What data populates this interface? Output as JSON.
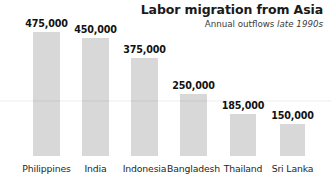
{
  "chart_data": {
    "type": "bar",
    "title": "Labor migration from Asia",
    "subtitle_prefix": "Annual outflows ",
    "subtitle_period": "late 1990s",
    "xlabel": "",
    "ylabel": "",
    "ylim": [
      0,
      500000
    ],
    "grid": false,
    "legend": "none",
    "categories": [
      "Philippines",
      "India",
      "Indonesia",
      "Bangladesh",
      "Thailand",
      "Sri Lanka"
    ],
    "values": [
      475000,
      450000,
      375000,
      250000,
      185000,
      150000
    ],
    "value_labels": [
      "475,000",
      "450,000",
      "375,000",
      "250,000",
      "185,000",
      "150,000"
    ],
    "bar_color": "#d8d8d8",
    "text_color": "#111111",
    "background_color": "#ffffff"
  },
  "bars": [
    {
      "category": "Philippines",
      "value": 475000,
      "label": "475,000",
      "left": 33,
      "width": 27,
      "height": 124
    },
    {
      "category": "India",
      "value": 450000,
      "label": "450,000",
      "left": 82,
      "width": 27,
      "height": 118
    },
    {
      "category": "Indonesia",
      "value": 375000,
      "label": "375,000",
      "left": 131,
      "width": 27,
      "height": 98
    },
    {
      "category": "Bangladesh",
      "value": 250000,
      "label": "250,000",
      "left": 180,
      "width": 27,
      "height": 62
    },
    {
      "category": "Thailand",
      "value": 185000,
      "label": "185,000",
      "left": 230,
      "width": 26,
      "height": 42
    },
    {
      "category": "Sri Lanka",
      "value": 150000,
      "label": "150,000",
      "left": 280,
      "width": 25,
      "height": 32
    }
  ]
}
